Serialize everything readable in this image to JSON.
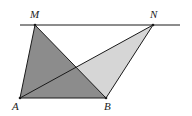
{
  "diagram": {
    "type": "geometry",
    "colors": {
      "dark_fill": "#8c8c8c",
      "light_fill": "#d6d6d6",
      "stroke": "#1a1a1a",
      "background": "#ffffff"
    },
    "line": {
      "x1": 20,
      "y1": 25,
      "x2": 180,
      "y2": 25
    },
    "points": {
      "M": {
        "x": 35,
        "y": 25,
        "label": "M",
        "lx": 30,
        "ly": 18
      },
      "N": {
        "x": 153,
        "y": 25,
        "label": "N",
        "lx": 150,
        "ly": 18
      },
      "A": {
        "x": 20,
        "y": 98,
        "label": "A",
        "lx": 12,
        "ly": 110
      },
      "B": {
        "x": 106,
        "y": 98,
        "label": "B",
        "lx": 104,
        "ly": 110
      }
    },
    "labels": {
      "M": "M",
      "N": "N",
      "A": "A",
      "B": "B"
    }
  }
}
